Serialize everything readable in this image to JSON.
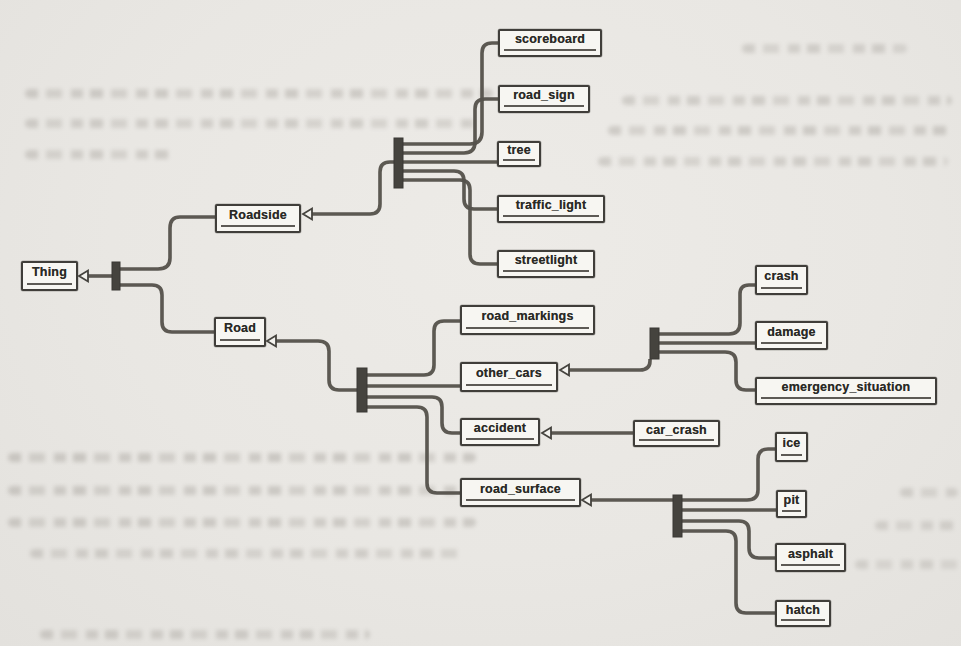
{
  "figure": {
    "type": "ontology-class-diagram",
    "root": "Thing",
    "nodes": {
      "thing": {
        "label": "Thing"
      },
      "roadside": {
        "label": "Roadside"
      },
      "road": {
        "label": "Road"
      },
      "scoreboard": {
        "label": "scoreboard"
      },
      "road_sign": {
        "label": "road_sign"
      },
      "tree": {
        "label": "tree"
      },
      "traffic_light": {
        "label": "traffic_light"
      },
      "streetlight": {
        "label": "streetlight"
      },
      "road_markings": {
        "label": "road_markings"
      },
      "other_cars": {
        "label": "other_cars"
      },
      "accident": {
        "label": "accident"
      },
      "car_crash": {
        "label": "car_crash"
      },
      "crash": {
        "label": "crash"
      },
      "damage": {
        "label": "damage"
      },
      "emergency_situation": {
        "label": "emergency_situation"
      },
      "road_surface": {
        "label": "road_surface"
      },
      "ice": {
        "label": "ice"
      },
      "pit": {
        "label": "pit"
      },
      "asphalt": {
        "label": "asphalt"
      },
      "hatch": {
        "label": "hatch"
      }
    },
    "edges": [
      {
        "child": "Roadside",
        "parent": "Thing",
        "relation": "is-a"
      },
      {
        "child": "Road",
        "parent": "Thing",
        "relation": "is-a"
      },
      {
        "child": "scoreboard",
        "parent": "Roadside",
        "relation": "is-a"
      },
      {
        "child": "road_sign",
        "parent": "Roadside",
        "relation": "is-a"
      },
      {
        "child": "tree",
        "parent": "Roadside",
        "relation": "is-a"
      },
      {
        "child": "traffic_light",
        "parent": "Roadside",
        "relation": "is-a"
      },
      {
        "child": "streetlight",
        "parent": "Roadside",
        "relation": "is-a"
      },
      {
        "child": "road_markings",
        "parent": "Road",
        "relation": "is-a"
      },
      {
        "child": "other_cars",
        "parent": "Road",
        "relation": "is-a"
      },
      {
        "child": "accident",
        "parent": "Road",
        "relation": "is-a"
      },
      {
        "child": "road_surface",
        "parent": "Road",
        "relation": "is-a"
      },
      {
        "child": "crash",
        "parent": "other_cars",
        "relation": "is-a"
      },
      {
        "child": "damage",
        "parent": "other_cars",
        "relation": "is-a"
      },
      {
        "child": "emergency_situation",
        "parent": "other_cars",
        "relation": "is-a"
      },
      {
        "child": "car_crash",
        "parent": "accident",
        "relation": "is-a"
      },
      {
        "child": "ice",
        "parent": "road_surface",
        "relation": "is-a"
      },
      {
        "child": "pit",
        "parent": "road_surface",
        "relation": "is-a"
      },
      {
        "child": "asphalt",
        "parent": "road_surface",
        "relation": "is-a"
      },
      {
        "child": "hatch",
        "parent": "road_surface",
        "relation": "is-a"
      }
    ],
    "colors": {
      "paper": "#e9e7e3",
      "node_fill": "#f7f6f2",
      "node_border": "#403e3a",
      "connector": "#55524c",
      "text": "#2a2a26"
    }
  }
}
